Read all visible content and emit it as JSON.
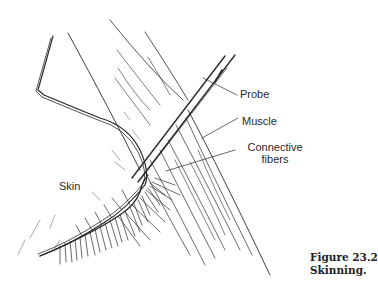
{
  "figure": {
    "labels": {
      "skin": "Skin",
      "probe": "Probe",
      "muscle": "Muscle",
      "connective_line1": "Connective",
      "connective_line2": "fibers"
    },
    "caption": {
      "number": "Figure 23.2",
      "title": "Skinning."
    },
    "colors": {
      "ink": "#2a2a2a",
      "background": "#ffffff"
    }
  }
}
